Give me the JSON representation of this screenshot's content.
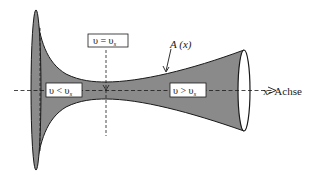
{
  "diagram": {
    "type": "laval-nozzle",
    "colors": {
      "fill": "#8a8a8a",
      "stroke": "#1a1a1a",
      "background": "#ffffff",
      "label_box": "#ffffff"
    },
    "labels": {
      "sonic": {
        "v": "υ",
        "op": " = ",
        "v2": "υ",
        "sub": "s"
      },
      "subsonic": {
        "v": "υ",
        "op": " < ",
        "v2": "υ",
        "sub": "s"
      },
      "supersonic": {
        "v": "υ",
        "op": " > ",
        "v2": "υ",
        "sub": "s"
      },
      "area": "A (x)",
      "axis": "x- Achse"
    }
  }
}
